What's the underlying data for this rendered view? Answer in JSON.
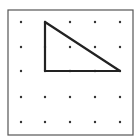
{
  "diagram": {
    "grid": {
      "rows": 5,
      "cols": 5,
      "x_positions": [
        21,
        45,
        70,
        95,
        120
      ],
      "y_positions": [
        22,
        47,
        71,
        97,
        122
      ],
      "dot_color": "#333333"
    },
    "frame": {
      "x": 8,
      "y": 10,
      "width": 125,
      "height": 125,
      "color": "#555555"
    },
    "triangle": {
      "vertices_grid": [
        [
          1,
          0
        ],
        [
          1,
          2
        ],
        [
          4,
          2
        ]
      ],
      "stroke_color": "#222222"
    }
  }
}
